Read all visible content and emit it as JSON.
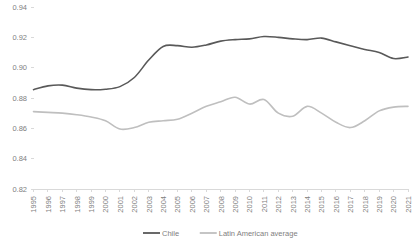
{
  "chart_data": {
    "type": "line",
    "title": "",
    "subtitle": "",
    "xlabel": "",
    "ylabel": "",
    "ylim": [
      0.82,
      0.94
    ],
    "ytick_values": [
      0.82,
      0.84,
      0.86,
      0.88,
      0.9,
      0.92,
      0.94
    ],
    "ytick_labels": [
      "0.82",
      "0.84",
      "0.86",
      "0.88",
      "0.90",
      "0.92",
      "0.94"
    ],
    "grid": false,
    "legend_position": "bottom-center",
    "x": [
      1995,
      1996,
      1997,
      1998,
      1999,
      2000,
      2001,
      2002,
      2003,
      2004,
      2005,
      2006,
      2007,
      2008,
      2009,
      2010,
      2011,
      2012,
      2013,
      2014,
      2015,
      2016,
      2017,
      2018,
      2019,
      2020,
      2021
    ],
    "categories": [
      "1995",
      "1996",
      "1997",
      "1998",
      "1999",
      "2000",
      "2001",
      "2002",
      "2003",
      "2004",
      "2005",
      "2006",
      "2007",
      "2008",
      "2009",
      "2010",
      "2011",
      "2012",
      "2013",
      "2014",
      "2015",
      "2016",
      "2017",
      "2018",
      "2019",
      "2020",
      "2021"
    ],
    "series": [
      {
        "name": "Chile",
        "color": "#595959",
        "values": [
          0.8855,
          0.888,
          0.8885,
          0.8865,
          0.8855,
          0.8858,
          0.8875,
          0.8935,
          0.905,
          0.914,
          0.9145,
          0.9135,
          0.915,
          0.9175,
          0.9185,
          0.919,
          0.9205,
          0.92,
          0.919,
          0.9185,
          0.9195,
          0.917,
          0.9145,
          0.912,
          0.91,
          0.906,
          0.907
        ]
      },
      {
        "name": "Latin American average",
        "color": "#bfbfbf",
        "values": [
          0.871,
          0.8705,
          0.87,
          0.869,
          0.8675,
          0.865,
          0.8595,
          0.8605,
          0.864,
          0.865,
          0.866,
          0.87,
          0.8745,
          0.8775,
          0.8805,
          0.876,
          0.879,
          0.87,
          0.868,
          0.8745,
          0.87,
          0.864,
          0.8605,
          0.865,
          0.8715,
          0.874,
          0.8745
        ]
      }
    ]
  },
  "legend": {
    "items": [
      {
        "label": "Chile",
        "color": "#595959"
      },
      {
        "label": "Latin American average",
        "color": "#bfbfbf"
      }
    ]
  },
  "axis": {
    "tick_color": "#d9d9d9",
    "label_color": "#808080"
  }
}
